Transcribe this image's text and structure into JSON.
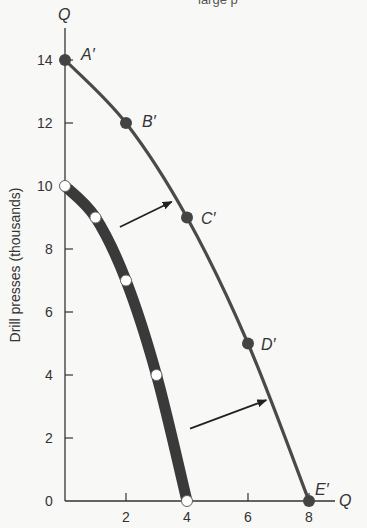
{
  "caption_partial": "large p",
  "chart_data": {
    "type": "line",
    "title": "",
    "xlabel": "Q",
    "ylabel": "Drill presses (thousands)",
    "y_axis_symbol": "Q",
    "x_axis_symbol": "Q",
    "xlim": [
      0,
      8.5
    ],
    "ylim": [
      0,
      15
    ],
    "x_ticks": [
      0,
      2,
      4,
      6,
      8
    ],
    "y_ticks": [
      0,
      2,
      4,
      6,
      8,
      10,
      12,
      14
    ],
    "grid": false,
    "series": [
      {
        "name": "Original production possibilities curve",
        "style": "thick",
        "marker": "open-circle",
        "points": [
          {
            "x": 0,
            "y": 10
          },
          {
            "x": 1,
            "y": 9
          },
          {
            "x": 2,
            "y": 7
          },
          {
            "x": 3,
            "y": 4
          },
          {
            "x": 4,
            "y": 0
          }
        ]
      },
      {
        "name": "Shifted production possibilities curve",
        "style": "thin",
        "marker": "filled-circle",
        "points": [
          {
            "x": 0,
            "y": 14,
            "label": "A′"
          },
          {
            "x": 2,
            "y": 12,
            "label": "B′"
          },
          {
            "x": 4,
            "y": 9,
            "label": "C′"
          },
          {
            "x": 6,
            "y": 5,
            "label": "D′"
          },
          {
            "x": 8,
            "y": 0,
            "label": "E′"
          }
        ]
      }
    ],
    "annotations": [
      {
        "type": "arrow",
        "from": {
          "x": 1.8,
          "y": 8.7
        },
        "to": {
          "x": 3.5,
          "y": 9.5
        },
        "meaning": "outward shift"
      },
      {
        "type": "arrow",
        "from": {
          "x": 4.1,
          "y": 2.3
        },
        "to": {
          "x": 6.6,
          "y": 3.2
        },
        "meaning": "outward shift"
      }
    ]
  },
  "colors": {
    "inner_curve": "#3a3a3a",
    "outer_curve": "#4a4a4a",
    "axis": "#333333",
    "background": "#f8f8f6"
  }
}
